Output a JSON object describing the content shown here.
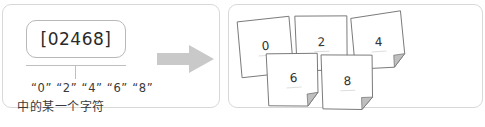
{
  "diagram": {
    "left": {
      "pattern_box": {
        "value": "[02468]"
      },
      "caption": {
        "characters_line": "“0” “2” “4” “6” “8”",
        "note_line": "中的某一个字符"
      }
    },
    "arrow": {
      "icon": "right-arrow-icon",
      "color": "#c9c9c9"
    },
    "right": {
      "cards": [
        {
          "digit": "0",
          "folded": false
        },
        {
          "digit": "2",
          "folded": true
        },
        {
          "digit": "4",
          "folded": true
        },
        {
          "digit": "6",
          "folded": true
        },
        {
          "digit": "8",
          "folded": true
        }
      ]
    },
    "colors": {
      "panel_border": "#d8d8d8",
      "box_border": "#b8b8b8",
      "card_border": "#7a7a7a",
      "fold_fill": "#bfbfbf",
      "text": "#2a2a2a"
    }
  }
}
